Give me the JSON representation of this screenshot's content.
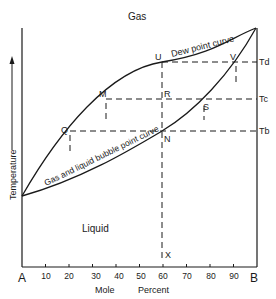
{
  "diagram": {
    "region_labels": {
      "gas": "Gas",
      "liquid": "Liquid"
    },
    "curves": {
      "dew_point": "Dew point curve",
      "bubble_point": "Gas and liquid bubble point curve"
    },
    "points": {
      "U": "U",
      "V": "V",
      "M": "M",
      "R": "R",
      "S": "S",
      "Q": "Q",
      "N": "N",
      "X": "X"
    },
    "temperature_levels": {
      "Td": "Td",
      "Tc": "Tc",
      "Tb": "Tb"
    },
    "axes": {
      "y_label": "Temperature",
      "x_label_1": "Mole",
      "x_label_2": "Percent",
      "left_end": "A",
      "right_end": "B",
      "x_ticks": [
        "10",
        "20",
        "30",
        "40",
        "50",
        "60",
        "70",
        "80",
        "90"
      ]
    }
  }
}
